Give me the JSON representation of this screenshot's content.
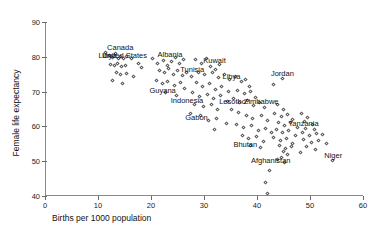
{
  "chart_data": {
    "type": "scatter",
    "title": "",
    "xlabel": "Births per 1000 population",
    "ylabel": "Female life expectancy",
    "xlim": [
      0,
      60
    ],
    "ylim": [
      40,
      90
    ],
    "xticks": [
      0,
      10,
      20,
      30,
      40,
      50,
      60
    ],
    "yticks": [
      40,
      50,
      60,
      70,
      80,
      90
    ],
    "grid": false,
    "legend": null,
    "marker": "open-diamond",
    "marker_color": "#555555",
    "annotations": [
      {
        "text": "Canada",
        "x": 14.0,
        "y": 82.8
      },
      {
        "text": "United States",
        "x": 14.8,
        "y": 80.6
      },
      {
        "text": "Libya",
        "x": 11.6,
        "y": 80.6
      },
      {
        "text": "Albania",
        "x": 23.4,
        "y": 80.8
      },
      {
        "text": "Kuwait",
        "x": 31.8,
        "y": 79.0
      },
      {
        "text": "Tunisia",
        "x": 27.6,
        "y": 76.6
      },
      {
        "text": "Jordan",
        "x": 44.6,
        "y": 75.4
      },
      {
        "text": "Libya",
        "x": 35.0,
        "y": 74.6
      },
      {
        "text": "Guyana",
        "x": 22.0,
        "y": 70.4
      },
      {
        "text": "Indonesia",
        "x": 26.6,
        "y": 67.6
      },
      {
        "text": "Lesotho",
        "x": 35.2,
        "y": 67.2
      },
      {
        "text": "Zimbabwe",
        "x": 40.6,
        "y": 67.4
      },
      {
        "text": "Gabon",
        "x": 28.4,
        "y": 62.6
      },
      {
        "text": "Tanzania",
        "x": 48.6,
        "y": 61.0
      },
      {
        "text": "Bhutan",
        "x": 37.6,
        "y": 54.8
      },
      {
        "text": "Afghanistan",
        "x": 42.4,
        "y": 50.4
      },
      {
        "text": "Niger",
        "x": 54.2,
        "y": 51.8
      }
    ],
    "points": [
      {
        "x": 11.2,
        "y": 81.2
      },
      {
        "x": 11.9,
        "y": 80.3
      },
      {
        "x": 12.6,
        "y": 79.9
      },
      {
        "x": 13.1,
        "y": 81.0
      },
      {
        "x": 13.6,
        "y": 79.6
      },
      {
        "x": 14.1,
        "y": 80.2
      },
      {
        "x": 14.6,
        "y": 79.4
      },
      {
        "x": 15.2,
        "y": 80.1
      },
      {
        "x": 12.2,
        "y": 77.8
      },
      {
        "x": 12.9,
        "y": 77.4
      },
      {
        "x": 13.5,
        "y": 78.0
      },
      {
        "x": 14.2,
        "y": 77.2
      },
      {
        "x": 15.0,
        "y": 77.6
      },
      {
        "x": 16.1,
        "y": 79.4
      },
      {
        "x": 17.4,
        "y": 78.1
      },
      {
        "x": 18.0,
        "y": 76.9
      },
      {
        "x": 13.3,
        "y": 75.4
      },
      {
        "x": 14.0,
        "y": 74.8
      },
      {
        "x": 15.1,
        "y": 75.2
      },
      {
        "x": 16.6,
        "y": 74.4
      },
      {
        "x": 12.6,
        "y": 73.1
      },
      {
        "x": 14.4,
        "y": 72.4
      },
      {
        "x": 20.0,
        "y": 79.6
      },
      {
        "x": 21.0,
        "y": 78.2
      },
      {
        "x": 22.1,
        "y": 79.0
      },
      {
        "x": 22.9,
        "y": 77.4
      },
      {
        "x": 23.6,
        "y": 78.6
      },
      {
        "x": 24.4,
        "y": 79.8
      },
      {
        "x": 25.1,
        "y": 78.0
      },
      {
        "x": 26.0,
        "y": 79.2
      },
      {
        "x": 21.5,
        "y": 76.2
      },
      {
        "x": 22.3,
        "y": 75.4
      },
      {
        "x": 23.2,
        "y": 76.6
      },
      {
        "x": 24.0,
        "y": 75.0
      },
      {
        "x": 24.9,
        "y": 76.0
      },
      {
        "x": 25.8,
        "y": 74.6
      },
      {
        "x": 26.6,
        "y": 75.6
      },
      {
        "x": 27.4,
        "y": 74.2
      },
      {
        "x": 20.8,
        "y": 73.2
      },
      {
        "x": 21.9,
        "y": 72.4
      },
      {
        "x": 23.0,
        "y": 73.0
      },
      {
        "x": 24.2,
        "y": 71.8
      },
      {
        "x": 25.4,
        "y": 72.6
      },
      {
        "x": 26.2,
        "y": 71.0
      },
      {
        "x": 22.6,
        "y": 69.6
      },
      {
        "x": 24.6,
        "y": 69.0
      },
      {
        "x": 28.2,
        "y": 79.2
      },
      {
        "x": 29.4,
        "y": 78.0
      },
      {
        "x": 30.2,
        "y": 79.4
      },
      {
        "x": 31.0,
        "y": 77.2
      },
      {
        "x": 31.9,
        "y": 76.4
      },
      {
        "x": 32.8,
        "y": 77.8
      },
      {
        "x": 28.8,
        "y": 75.6
      },
      {
        "x": 29.9,
        "y": 74.8
      },
      {
        "x": 31.4,
        "y": 75.4
      },
      {
        "x": 32.6,
        "y": 74.0
      },
      {
        "x": 33.6,
        "y": 75.0
      },
      {
        "x": 34.6,
        "y": 73.4
      },
      {
        "x": 28.4,
        "y": 72.6
      },
      {
        "x": 29.6,
        "y": 71.4
      },
      {
        "x": 30.8,
        "y": 72.2
      },
      {
        "x": 32.0,
        "y": 70.6
      },
      {
        "x": 33.2,
        "y": 71.4
      },
      {
        "x": 34.4,
        "y": 70.0
      },
      {
        "x": 27.6,
        "y": 69.8
      },
      {
        "x": 29.0,
        "y": 68.6
      },
      {
        "x": 30.4,
        "y": 69.2
      },
      {
        "x": 31.6,
        "y": 68.0
      },
      {
        "x": 33.0,
        "y": 68.8
      },
      {
        "x": 34.2,
        "y": 67.2
      },
      {
        "x": 28.0,
        "y": 66.4
      },
      {
        "x": 29.8,
        "y": 65.6
      },
      {
        "x": 31.2,
        "y": 66.2
      },
      {
        "x": 32.4,
        "y": 64.8
      },
      {
        "x": 27.2,
        "y": 63.8
      },
      {
        "x": 29.2,
        "y": 63.0
      },
      {
        "x": 30.6,
        "y": 61.8
      },
      {
        "x": 32.2,
        "y": 62.4
      },
      {
        "x": 34.0,
        "y": 60.8
      },
      {
        "x": 31.8,
        "y": 59.2
      },
      {
        "x": 35.8,
        "y": 74.4
      },
      {
        "x": 36.8,
        "y": 72.8
      },
      {
        "x": 37.6,
        "y": 73.6
      },
      {
        "x": 38.4,
        "y": 71.6
      },
      {
        "x": 36.2,
        "y": 70.2
      },
      {
        "x": 37.4,
        "y": 69.4
      },
      {
        "x": 38.6,
        "y": 70.0
      },
      {
        "x": 39.6,
        "y": 68.4
      },
      {
        "x": 35.4,
        "y": 68.0
      },
      {
        "x": 36.6,
        "y": 66.8
      },
      {
        "x": 38.0,
        "y": 67.4
      },
      {
        "x": 39.2,
        "y": 66.0
      },
      {
        "x": 40.2,
        "y": 67.0
      },
      {
        "x": 41.2,
        "y": 65.4
      },
      {
        "x": 35.0,
        "y": 64.8
      },
      {
        "x": 36.4,
        "y": 64.0
      },
      {
        "x": 37.8,
        "y": 63.2
      },
      {
        "x": 39.0,
        "y": 62.4
      },
      {
        "x": 40.6,
        "y": 63.0
      },
      {
        "x": 41.8,
        "y": 61.6
      },
      {
        "x": 36.0,
        "y": 60.6
      },
      {
        "x": 37.2,
        "y": 59.8
      },
      {
        "x": 38.8,
        "y": 60.2
      },
      {
        "x": 40.0,
        "y": 58.8
      },
      {
        "x": 41.4,
        "y": 59.4
      },
      {
        "x": 42.6,
        "y": 58.2
      },
      {
        "x": 37.0,
        "y": 57.4
      },
      {
        "x": 38.2,
        "y": 56.6
      },
      {
        "x": 39.8,
        "y": 57.0
      },
      {
        "x": 41.0,
        "y": 55.8
      },
      {
        "x": 38.6,
        "y": 54.6
      },
      {
        "x": 40.4,
        "y": 53.8
      },
      {
        "x": 43.0,
        "y": 72.0
      },
      {
        "x": 44.6,
        "y": 73.8
      },
      {
        "x": 43.6,
        "y": 66.2
      },
      {
        "x": 44.8,
        "y": 65.0
      },
      {
        "x": 43.2,
        "y": 63.6
      },
      {
        "x": 44.4,
        "y": 62.8
      },
      {
        "x": 45.6,
        "y": 63.4
      },
      {
        "x": 46.6,
        "y": 62.0
      },
      {
        "x": 43.8,
        "y": 61.2
      },
      {
        "x": 45.0,
        "y": 60.4
      },
      {
        "x": 46.2,
        "y": 61.0
      },
      {
        "x": 47.4,
        "y": 59.8
      },
      {
        "x": 43.4,
        "y": 59.0
      },
      {
        "x": 44.6,
        "y": 58.2
      },
      {
        "x": 45.8,
        "y": 58.8
      },
      {
        "x": 47.0,
        "y": 57.4
      },
      {
        "x": 43.0,
        "y": 56.8
      },
      {
        "x": 44.2,
        "y": 56.0
      },
      {
        "x": 45.4,
        "y": 56.6
      },
      {
        "x": 46.6,
        "y": 55.2
      },
      {
        "x": 44.0,
        "y": 54.4
      },
      {
        "x": 45.2,
        "y": 53.6
      },
      {
        "x": 46.4,
        "y": 54.2
      },
      {
        "x": 44.8,
        "y": 52.8
      },
      {
        "x": 45.6,
        "y": 52.0
      },
      {
        "x": 44.4,
        "y": 51.2
      },
      {
        "x": 43.6,
        "y": 50.4
      },
      {
        "x": 45.0,
        "y": 49.6
      },
      {
        "x": 42.2,
        "y": 47.2
      },
      {
        "x": 41.4,
        "y": 44.0
      },
      {
        "x": 41.8,
        "y": 40.6
      },
      {
        "x": 48.2,
        "y": 63.8
      },
      {
        "x": 49.4,
        "y": 62.6
      },
      {
        "x": 48.8,
        "y": 61.4
      },
      {
        "x": 50.2,
        "y": 60.6
      },
      {
        "x": 49.0,
        "y": 59.4
      },
      {
        "x": 50.6,
        "y": 59.0
      },
      {
        "x": 48.4,
        "y": 58.2
      },
      {
        "x": 49.8,
        "y": 57.4
      },
      {
        "x": 51.0,
        "y": 58.0
      },
      {
        "x": 48.6,
        "y": 56.2
      },
      {
        "x": 50.0,
        "y": 55.4
      },
      {
        "x": 51.4,
        "y": 56.0
      },
      {
        "x": 49.2,
        "y": 54.2
      },
      {
        "x": 50.8,
        "y": 53.4
      },
      {
        "x": 48.0,
        "y": 52.6
      },
      {
        "x": 54.0,
        "y": 50.2
      },
      {
        "x": 52.2,
        "y": 57.6
      },
      {
        "x": 53.0,
        "y": 55.0
      }
    ]
  }
}
